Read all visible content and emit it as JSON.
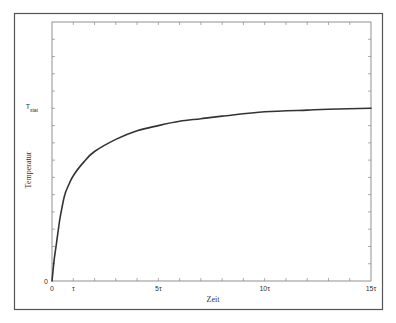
{
  "chart_data": {
    "type": "line",
    "title": "",
    "xlabel": "Zeit",
    "ylabel": "Temperatur",
    "xlim": [
      0,
      15
    ],
    "ylim": [
      0,
      15
    ],
    "x_unit": "τ",
    "x_tick_labels": [
      {
        "value": 0,
        "label": "0"
      },
      {
        "value": 1,
        "label": "τ"
      },
      {
        "value": 5,
        "label": "5τ"
      },
      {
        "value": 10,
        "label": "10τ"
      },
      {
        "value": 15,
        "label": "15τ"
      }
    ],
    "y_tick_labels": [
      {
        "value": 0,
        "label": "0"
      },
      {
        "value": 10,
        "label": "T",
        "sub": "stat"
      }
    ],
    "minor_ticks": {
      "x_step": 1,
      "y_step": 1
    },
    "grid": false,
    "legend": null,
    "series": [
      {
        "name": "Temperatur",
        "color": "#333333",
        "x": [
          0,
          0.1,
          0.2,
          0.3,
          0.4,
          0.6,
          0.8,
          1.0,
          1.5,
          2.0,
          3.0,
          4.0,
          5.0,
          6.0,
          7.0,
          8.0,
          10.0,
          12.0,
          13.0,
          15.0
        ],
        "y": [
          0,
          1.2,
          2.1,
          3.0,
          3.8,
          5.0,
          5.6,
          6.1,
          6.9,
          7.5,
          8.2,
          8.7,
          9.0,
          9.25,
          9.4,
          9.55,
          9.8,
          9.9,
          9.95,
          10.0
        ]
      }
    ]
  },
  "frame": {
    "border_color": "#555555"
  }
}
